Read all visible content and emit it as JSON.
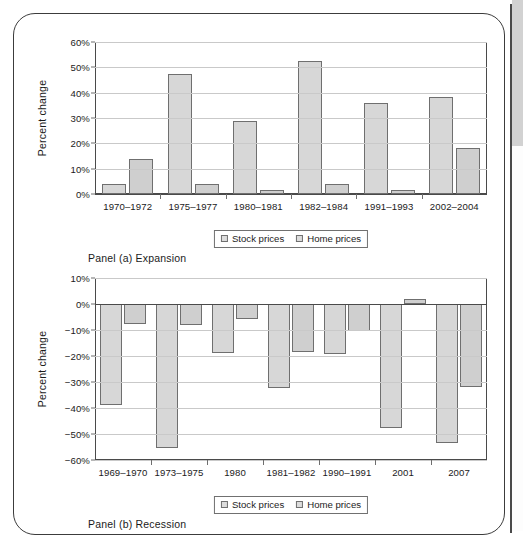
{
  "figure": {
    "frame": {
      "border_color": "#3c3c3c",
      "edge_rule_color": "#4a4a4a",
      "edge_tab_color": "#d2d2d2"
    },
    "legend_labels": [
      "Stock prices",
      "Home prices"
    ],
    "series_colors": {
      "stock": "#d7d7d7",
      "home": "#cfcfcf",
      "bar_outline": "#6f6f6f"
    }
  },
  "panel_a": {
    "caption": "Panel (a) Expansion",
    "legend": {
      "stock": "Stock prices",
      "home": "Home prices"
    }
  },
  "panel_b": {
    "caption": "Panel (b) Recession",
    "legend": {
      "stock": "Stock prices",
      "home": "Home prices"
    }
  },
  "chart_data": [
    {
      "id": "panel-a",
      "type": "bar",
      "title": "Panel (a) Expansion",
      "xlabel": "",
      "ylabel": "Percent change",
      "ylim": [
        0,
        60
      ],
      "ytick_step": 10,
      "ytick_labels": [
        "0%",
        "10%",
        "20%",
        "30%",
        "40%",
        "50%",
        "60%"
      ],
      "ytick_values": [
        0,
        10,
        20,
        30,
        40,
        50,
        60
      ],
      "grid": true,
      "legend_position": "below-axis-center",
      "categories": [
        "1970–1972",
        "1975–1977",
        "1980–1981",
        "1982–1984",
        "1991–1993",
        "2002–2004"
      ],
      "series": [
        {
          "name": "Stock prices",
          "values": [
            4,
            47.5,
            29,
            52.5,
            35.8,
            38.2
          ]
        },
        {
          "name": "Home prices",
          "values": [
            13.8,
            3.8,
            1.4,
            4.1,
            1.6,
            18
          ]
        }
      ]
    },
    {
      "id": "panel-b",
      "type": "bar",
      "title": "Panel (b) Recession",
      "xlabel": "",
      "ylabel": "Percent change",
      "ylim": [
        -60,
        10
      ],
      "ytick_step": 10,
      "ytick_labels": [
        "10%",
        "0%",
        "−10%",
        "−20%",
        "−30%",
        "−40%",
        "−50%",
        "−60%"
      ],
      "ytick_values": [
        10,
        0,
        -10,
        -20,
        -30,
        -40,
        -50,
        -60
      ],
      "grid": true,
      "legend_position": "below-axis-center",
      "categories": [
        "1969–1970",
        "1973–1975",
        "1980",
        "1981–1982",
        "1990–1991",
        "2001",
        "2007"
      ],
      "series": [
        {
          "name": "Stock prices",
          "values": [
            -39,
            -55.3,
            -19,
            -32.2,
            -19.4,
            -47.8,
            -53.3
          ]
        },
        {
          "name": "Home prices",
          "values": [
            -7.8,
            -7.9,
            -5.9,
            -18.5,
            -10.5,
            1.9,
            -31.8
          ]
        }
      ]
    }
  ]
}
